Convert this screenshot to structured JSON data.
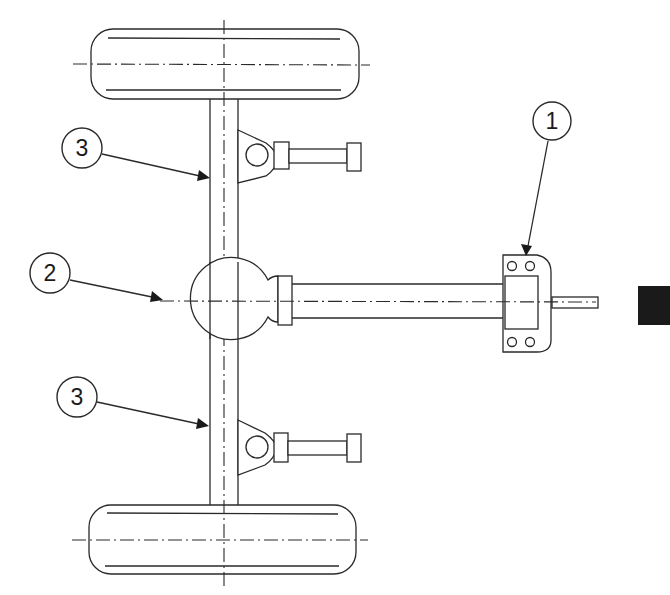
{
  "diagram": {
    "title": "",
    "colors": {
      "line": "#2a2a2a",
      "background": "#ffffff",
      "tab_marker": "#1a1a1a"
    },
    "callouts": [
      {
        "id": "1",
        "label": "1",
        "cx": 552,
        "cy": 121,
        "r": 19,
        "target_x": 527,
        "target_y": 255
      },
      {
        "id": "2",
        "label": "2",
        "cx": 50,
        "cy": 273,
        "r": 20,
        "target_x": 162,
        "target_y": 298
      },
      {
        "id": "3a",
        "label": "3",
        "cx": 82,
        "cy": 148,
        "r": 20,
        "target_x": 210,
        "target_y": 178
      },
      {
        "id": "3b",
        "label": "3",
        "cx": 77,
        "cy": 397,
        "r": 20,
        "target_x": 209,
        "target_y": 426
      }
    ],
    "parts": [
      {
        "name": "front-wheel",
        "kind": "wheel"
      },
      {
        "name": "rear-wheel",
        "kind": "wheel"
      },
      {
        "name": "axle-beam",
        "kind": "beam"
      },
      {
        "name": "differential-housing",
        "kind": "housing"
      },
      {
        "name": "drive-shaft-tube",
        "kind": "tube"
      },
      {
        "name": "mounting-bracket",
        "kind": "bracket"
      },
      {
        "name": "upper-suspension-link",
        "kind": "link"
      },
      {
        "name": "lower-suspension-link",
        "kind": "link"
      }
    ],
    "page_tab": {
      "visible": true
    }
  }
}
